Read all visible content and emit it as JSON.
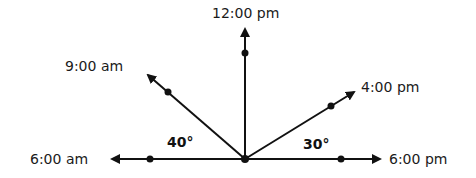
{
  "diagram": {
    "type": "sun-position-rays",
    "origin": {
      "x": 245,
      "y": 159
    },
    "colors": {
      "stroke": "#111111",
      "text": "#1a1a1a",
      "background": "#ffffff"
    },
    "rays": [
      {
        "id": "6am",
        "label": "6:00 am",
        "direction": "left"
      },
      {
        "id": "9am",
        "label": "9:00 am",
        "direction": "upper-left"
      },
      {
        "id": "12pm",
        "label": "12:00 pm",
        "direction": "up"
      },
      {
        "id": "4pm",
        "label": "4:00 pm",
        "direction": "upper-right"
      },
      {
        "id": "6pm",
        "label": "6:00 pm",
        "direction": "right"
      }
    ],
    "angles": [
      {
        "id": "angle-left",
        "label": "40°",
        "between": [
          "6am",
          "9am"
        ]
      },
      {
        "id": "angle-right",
        "label": "30°",
        "between": [
          "4pm",
          "6pm"
        ]
      }
    ]
  }
}
